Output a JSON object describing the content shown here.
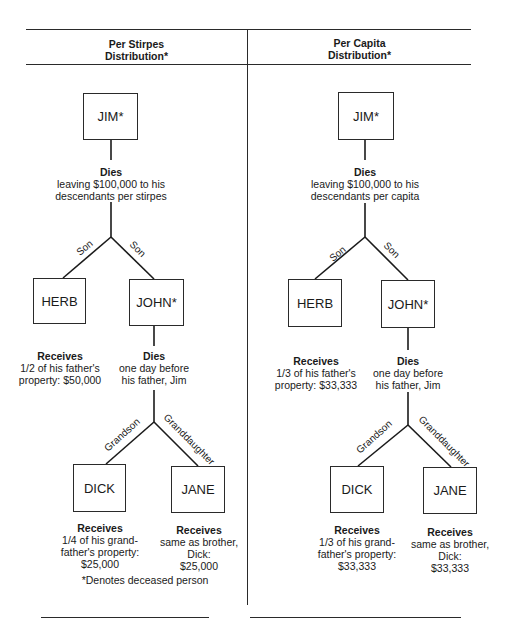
{
  "panels": [
    {
      "id": "per-stirpes",
      "header": [
        "Per Stirpes",
        "Distribution*"
      ],
      "root": {
        "name": "JIM*",
        "event_title": "Dies",
        "event_lines": [
          "leaving $100,000 to his",
          "descendants per stirpes"
        ]
      },
      "children": [
        {
          "name": "HERB",
          "edge_label": "Son",
          "title": "Receives",
          "lines": [
            "1/2 of his father's",
            "property: $50,000"
          ]
        },
        {
          "name": "JOHN*",
          "edge_label": "Son",
          "title": "Dies",
          "lines": [
            "one day before",
            "his father, Jim"
          ]
        }
      ],
      "grandchildren": [
        {
          "name": "DICK",
          "edge_label": "Grandson",
          "title": "Receives",
          "lines": [
            "1/4 of his grand-",
            "father's property:",
            "$25,000"
          ]
        },
        {
          "name": "JANE",
          "edge_label": "Granddaughter",
          "title": "Receives",
          "lines": [
            "same as brother,",
            "Dick:",
            "$25,000"
          ]
        }
      ],
      "footnote": "*Denotes deceased person"
    },
    {
      "id": "per-capita",
      "header": [
        "Per Capita",
        "Distribution*"
      ],
      "root": {
        "name": "JIM*",
        "event_title": "Dies",
        "event_lines": [
          "leaving $100,000 to his",
          "descendants per capita"
        ]
      },
      "children": [
        {
          "name": "HERB",
          "edge_label": "Son",
          "title": "Receives",
          "lines": [
            "1/3 of his father's",
            "property: $33,333"
          ]
        },
        {
          "name": "JOHN*",
          "edge_label": "Son",
          "title": "Dies",
          "lines": [
            "one day before",
            "his father, Jim"
          ]
        }
      ],
      "grandchildren": [
        {
          "name": "DICK",
          "edge_label": "Grandson",
          "title": "Receives",
          "lines": [
            "1/3 of his grand-",
            "father's property:",
            "$33,333"
          ]
        },
        {
          "name": "JANE",
          "edge_label": "Granddaughter",
          "title": "Receives",
          "lines": [
            "same as brother,",
            "Dick:",
            "$33,333"
          ]
        }
      ]
    }
  ]
}
